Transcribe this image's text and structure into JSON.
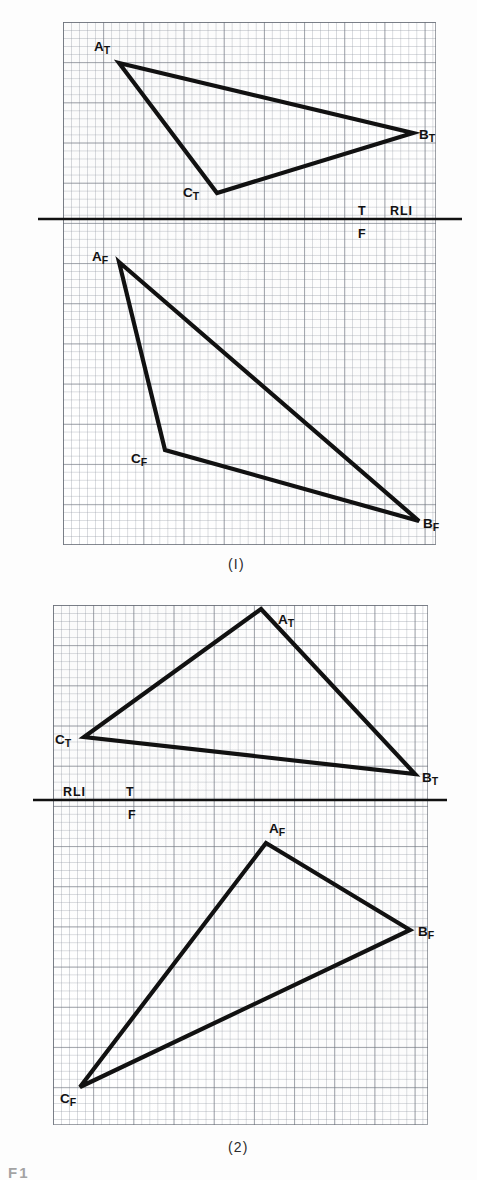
{
  "sheet": {
    "width": 477,
    "height": 1180,
    "background": "#fdfdfd",
    "ink_color": "#111111",
    "grid_minor_color": "#969ca6",
    "grid_major_color": "#6e737d"
  },
  "figures": [
    {
      "id": "figure-1",
      "caption": "(I)",
      "caption_x": 228,
      "caption_y": 556,
      "frame": {
        "x": 63,
        "y": 22,
        "width": 373,
        "height": 523
      },
      "grid": {
        "minor_px": 8.04,
        "major_every": 5
      },
      "reference_line": {
        "label": "RLI",
        "upper_view_label": "T",
        "lower_view_label": "F",
        "y": 219,
        "x1": 38,
        "x2": 462,
        "label_x": 390,
        "label_y": 205,
        "t_x": 358,
        "t_y": 205,
        "f_x": 358,
        "f_y": 228
      },
      "views": [
        {
          "name": "top-view",
          "view_code": "T",
          "vertices": [
            {
              "label": "A",
              "sub": "T",
              "x": 119,
              "y": 63,
              "label_x": 94,
              "label_y": 40
            },
            {
              "label": "B",
              "sub": "T",
              "x": 413,
              "y": 133,
              "label_x": 419,
              "label_y": 128
            },
            {
              "label": "C",
              "sub": "T",
              "x": 217,
              "y": 193,
              "label_x": 183,
              "label_y": 186
            }
          ]
        },
        {
          "name": "front-view",
          "view_code": "F",
          "vertices": [
            {
              "label": "A",
              "sub": "F",
              "x": 119,
              "y": 262,
              "label_x": 92,
              "label_y": 250
            },
            {
              "label": "B",
              "sub": "F",
              "x": 419,
              "y": 521,
              "label_x": 423,
              "label_y": 517
            },
            {
              "label": "C",
              "sub": "F",
              "x": 165,
              "y": 450,
              "label_x": 131,
              "label_y": 452
            }
          ]
        }
      ]
    },
    {
      "id": "figure-2",
      "caption": "(2)",
      "caption_x": 228,
      "caption_y": 1139,
      "frame": {
        "x": 53,
        "y": 605,
        "width": 375,
        "height": 520
      },
      "grid": {
        "minor_px": 8.04,
        "major_every": 5
      },
      "reference_line": {
        "label": "RLI",
        "upper_view_label": "T",
        "lower_view_label": "F",
        "y": 800,
        "x1": 33,
        "x2": 447,
        "label_x": 63,
        "label_y": 786,
        "t_x": 126,
        "t_y": 786,
        "f_x": 128,
        "f_y": 809
      },
      "views": [
        {
          "name": "top-view",
          "view_code": "T",
          "vertices": [
            {
              "label": "A",
              "sub": "T",
              "x": 261,
              "y": 609,
              "label_x": 278,
              "label_y": 613
            },
            {
              "label": "B",
              "sub": "T",
              "x": 415,
              "y": 774,
              "label_x": 422,
              "label_y": 771
            },
            {
              "label": "C",
              "sub": "T",
              "x": 84,
              "y": 737,
              "label_x": 55,
              "label_y": 733
            }
          ]
        },
        {
          "name": "front-view",
          "view_code": "F",
          "vertices": [
            {
              "label": "A",
              "sub": "F",
              "x": 266,
              "y": 843,
              "label_x": 269,
              "label_y": 822
            },
            {
              "label": "B",
              "sub": "F",
              "x": 410,
              "y": 930,
              "label_x": 418,
              "label_y": 925
            },
            {
              "label": "C",
              "sub": "F",
              "x": 80,
              "y": 1087,
              "label_x": 60,
              "label_y": 1092
            }
          ]
        }
      ]
    }
  ],
  "bottom_cropped_text": "F1",
  "line_weights": {
    "triangle_stroke": 4.2,
    "reference_line_stroke": 2.6
  }
}
